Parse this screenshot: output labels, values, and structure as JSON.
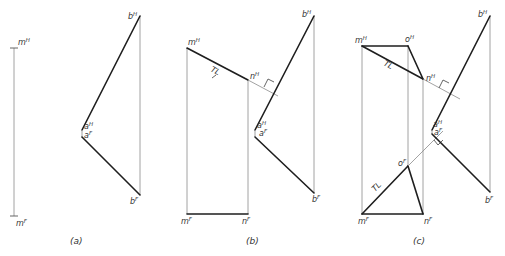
{
  "figure": {
    "panels": [
      {
        "caption": "(a)",
        "labels": {
          "mH": {
            "base": "m",
            "sup": "H"
          },
          "mF": {
            "base": "m",
            "sup": "F"
          },
          "aH": {
            "base": "a",
            "sup": "H"
          },
          "aF": {
            "base": "a",
            "sup": "F"
          },
          "bH": {
            "base": "b",
            "sup": "H"
          },
          "bF": {
            "base": "b",
            "sup": "F"
          }
        }
      },
      {
        "caption": "(b)",
        "labels": {
          "mH": {
            "base": "m",
            "sup": "H"
          },
          "nH": {
            "base": "n",
            "sup": "H"
          },
          "mF": {
            "base": "m",
            "sup": "F"
          },
          "nF": {
            "base": "n",
            "sup": "F"
          },
          "aH": {
            "base": "a",
            "sup": "H"
          },
          "aF": {
            "base": "a",
            "sup": "F"
          },
          "bH": {
            "base": "b",
            "sup": "H"
          },
          "bF": {
            "base": "b",
            "sup": "F"
          },
          "tl": "TL"
        }
      },
      {
        "caption": "(c)",
        "labels": {
          "mH": {
            "base": "m",
            "sup": "H"
          },
          "oH": {
            "base": "o",
            "sup": "H"
          },
          "nH": {
            "base": "n",
            "sup": "H"
          },
          "mF": {
            "base": "m",
            "sup": "F"
          },
          "oF": {
            "base": "o",
            "sup": "F"
          },
          "nF": {
            "base": "n",
            "sup": "F"
          },
          "aH": {
            "base": "a",
            "sup": "H"
          },
          "aF": {
            "base": "a",
            "sup": "F"
          },
          "bH": {
            "base": "b",
            "sup": "H"
          },
          "bF": {
            "base": "b",
            "sup": "F"
          },
          "tl_top": "TL",
          "tl_bottom": "TL"
        }
      }
    ]
  }
}
